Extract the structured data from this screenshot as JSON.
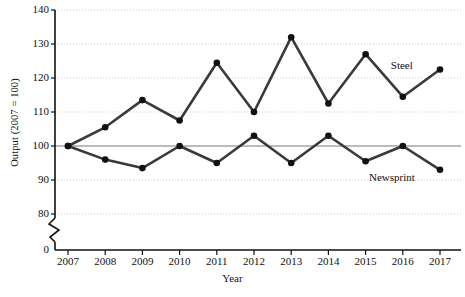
{
  "chart_data": {
    "type": "line",
    "title": "",
    "xlabel": "Year",
    "ylabel": "Output (2007 = 100)",
    "categories": [
      "2007",
      "2008",
      "2009",
      "2010",
      "2011",
      "2012",
      "2013",
      "2014",
      "2015",
      "2016",
      "2017"
    ],
    "x": [
      2007,
      2008,
      2009,
      2010,
      2011,
      2012,
      2013,
      2014,
      2015,
      2016,
      2017
    ],
    "series": [
      {
        "name": "Steel",
        "values": [
          100,
          105.5,
          113.5,
          107.5,
          124.5,
          110,
          132,
          112.5,
          127,
          114.5,
          122.5
        ],
        "color": "#3a3a3a"
      },
      {
        "name": "Newsprint",
        "values": [
          100,
          96,
          93.5,
          100,
          95,
          103,
          95,
          103,
          95.5,
          100,
          93
        ],
        "color": "#3a3a3a"
      }
    ],
    "ylim": [
      75,
      140
    ],
    "y_ticks": [
      80,
      90,
      100,
      110,
      120,
      130,
      140
    ],
    "y_axis_break": true,
    "y_axis_origin_label": "0",
    "reference_line": {
      "value": 100,
      "color": "#777777"
    },
    "grid": {
      "horizontal": true,
      "style": "dotted",
      "color": "#c9c9c9"
    },
    "legend": {
      "position": "inline-labels"
    },
    "annotations": [
      {
        "text": "Steel",
        "x": 2016.35,
        "y": 123.5
      },
      {
        "text": "Newsprint",
        "x": 2016.3,
        "y": 90.5
      }
    ]
  }
}
